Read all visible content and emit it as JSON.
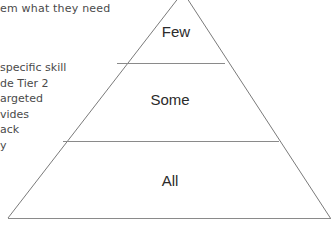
{
  "left_text": {
    "top_line": "em what they need",
    "body_lines": [
      "specific skill",
      "de Tier 2",
      "argeted",
      "vides",
      "ack",
      "y"
    ]
  },
  "pyramid": {
    "tiers": [
      {
        "label": "Few"
      },
      {
        "label": "Some"
      },
      {
        "label": "All"
      }
    ],
    "line_color": "#7a7a7a"
  }
}
